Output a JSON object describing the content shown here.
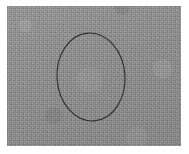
{
  "figure": {
    "title": "Grayscale textured image with hand-drawn ellipse annotation",
    "caption": "",
    "width_px": 189,
    "height_px": 154,
    "background_color": "#ffffff"
  },
  "image_region": {
    "name": "gray-textured-plate",
    "description": "Uniform mid-gray noisy photographic surface",
    "base_color": "#8b8b8b",
    "noise_color_light": "#9d9d9d",
    "noise_color_dark": "#7a7a7a",
    "left_px": 7,
    "top_px": 6,
    "width_px": 174,
    "height_px": 140
  },
  "annotation": {
    "name": "ellipse-outline",
    "shape": "ellipse",
    "label": "",
    "stroke_color": "#2e2e2e",
    "stroke_width_px": 1.1,
    "fill": "none",
    "center_x_px": 91,
    "center_y_px": 77,
    "radius_x_px": 34,
    "radius_y_px": 44,
    "rotation_deg": -4
  }
}
